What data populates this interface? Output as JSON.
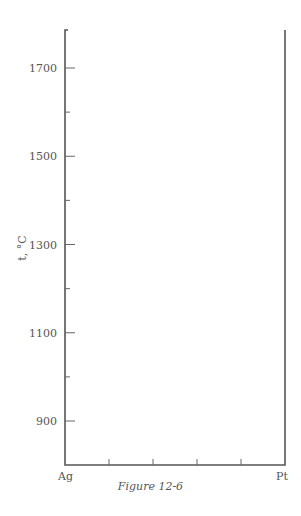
{
  "chart_data": {
    "type": "line",
    "title": "",
    "caption": "Figure 12-6",
    "xlabel": "",
    "ylabel": "t, °C",
    "x_endpoints": [
      "Ag",
      "Pt"
    ],
    "x_minor_ticks": 4,
    "yticks_labeled": [
      900,
      1100,
      1300,
      1500,
      1700
    ],
    "yticks_all": [
      900,
      1000,
      1100,
      1200,
      1300,
      1400,
      1500,
      1600,
      1700
    ],
    "ylim": [
      800,
      1780
    ],
    "grid": false,
    "series": []
  },
  "figure": {
    "caption": "Figure 12-6",
    "ylabel": "t, °C",
    "x_left_label": "Ag",
    "x_right_label": "Pt",
    "y_tick_labels": [
      "1700",
      "1500",
      "1300",
      "1100",
      "900"
    ]
  }
}
